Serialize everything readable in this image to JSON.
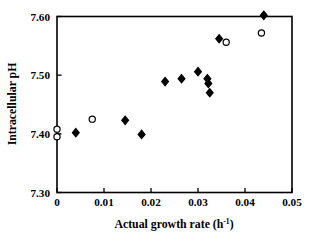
{
  "chart_data": {
    "type": "scatter",
    "title": "",
    "xlabel": "Actual growth rate (h-1)",
    "xlabel_base": "Actual growth rate (h",
    "xlabel_sup": "-1",
    "xlabel_tail": ")",
    "ylabel": "Intracellular pH",
    "xlim": [
      0,
      0.05
    ],
    "ylim": [
      7.3,
      7.6
    ],
    "xticks": [
      0,
      0.01,
      0.02,
      0.03,
      0.04,
      0.05
    ],
    "xtick_labels": [
      "0",
      "0.01",
      "0.02",
      "0.03",
      "0.04",
      "0.05"
    ],
    "yticks": [
      7.3,
      7.4,
      7.5,
      7.6
    ],
    "ytick_labels": [
      "7.30",
      "7.40",
      "7.50",
      "7.60"
    ],
    "grid": false,
    "legend": "none",
    "marker_color": "#000000",
    "axis_color": "#000000",
    "series": [
      {
        "name": "filled-diamond",
        "marker": "filled-diamond",
        "fill": "#000000",
        "stroke": "#000000",
        "points": [
          {
            "x": 0.004,
            "y": 7.402
          },
          {
            "x": 0.0145,
            "y": 7.423
          },
          {
            "x": 0.018,
            "y": 7.399
          },
          {
            "x": 0.023,
            "y": 7.489
          },
          {
            "x": 0.0265,
            "y": 7.494
          },
          {
            "x": 0.03,
            "y": 7.506
          },
          {
            "x": 0.032,
            "y": 7.494
          },
          {
            "x": 0.0322,
            "y": 7.486
          },
          {
            "x": 0.0325,
            "y": 7.47
          },
          {
            "x": 0.0345,
            "y": 7.562
          },
          {
            "x": 0.044,
            "y": 7.602
          }
        ]
      },
      {
        "name": "open-circle",
        "marker": "open-circle",
        "fill": "#ffffff",
        "stroke": "#000000",
        "points": [
          {
            "x": 0.0,
            "y": 7.408
          },
          {
            "x": 0.0,
            "y": 7.395
          },
          {
            "x": 0.0075,
            "y": 7.425
          },
          {
            "x": 0.036,
            "y": 7.556
          },
          {
            "x": 0.0435,
            "y": 7.572
          }
        ]
      }
    ]
  }
}
